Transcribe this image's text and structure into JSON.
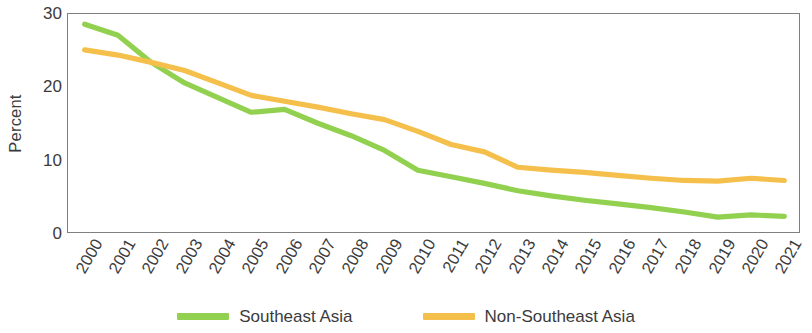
{
  "chart_data": {
    "type": "line",
    "title": "",
    "xlabel": "",
    "ylabel": "Percent",
    "ylim": [
      0,
      30
    ],
    "yticks": [
      0,
      10,
      20,
      30
    ],
    "grid": false,
    "legend_position": "bottom",
    "categories": [
      "2000",
      "2001",
      "2002",
      "2003",
      "2004",
      "2005",
      "2006",
      "2007",
      "2008",
      "2009",
      "2010",
      "2011",
      "2012",
      "2013",
      "2014",
      "2015",
      "2016",
      "2017",
      "2018",
      "2019",
      "2020",
      "2021"
    ],
    "series": [
      {
        "name": "Southeast Asia",
        "color": "#92D050",
        "values": [
          28.6,
          27.1,
          23.4,
          20.6,
          18.6,
          16.6,
          17.0,
          15.1,
          13.4,
          11.4,
          8.7,
          7.8,
          6.9,
          5.9,
          5.2,
          4.6,
          4.1,
          3.6,
          3.0,
          2.3,
          2.6,
          2.4
        ]
      },
      {
        "name": "Non-Southeast Asia",
        "color": "#F5BF4B",
        "values": [
          25.1,
          24.4,
          23.4,
          22.3,
          20.6,
          18.9,
          18.1,
          17.3,
          16.4,
          15.6,
          14.0,
          12.2,
          11.2,
          9.1,
          8.7,
          8.4,
          8.0,
          7.6,
          7.3,
          7.2,
          7.6,
          7.3
        ]
      }
    ]
  },
  "axes": {
    "y_title": "Percent",
    "y_tick_labels": [
      "0",
      "10",
      "20",
      "30"
    ],
    "x_tick_labels": [
      "2000",
      "2001",
      "2002",
      "2003",
      "2004",
      "2005",
      "2006",
      "2007",
      "2008",
      "2009",
      "2010",
      "2011",
      "2012",
      "2013",
      "2014",
      "2015",
      "2016",
      "2017",
      "2018",
      "2019",
      "2020",
      "2021"
    ]
  },
  "legend": {
    "items": [
      {
        "label": "Southeast Asia",
        "color": "#92D050"
      },
      {
        "label": "Non-Southeast Asia",
        "color": "#F5BF4B"
      }
    ]
  }
}
